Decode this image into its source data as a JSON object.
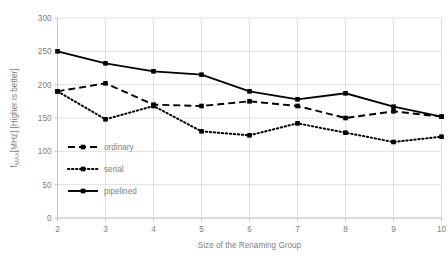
{
  "chart_data": {
    "type": "line",
    "title": "",
    "xlabel": "Size of the Renaming Group",
    "ylabel": "fₘₐₓ[MHz] [Higher is better]",
    "ylabel_parts": {
      "prefix": "f",
      "subscript": "MAX",
      "suffix": "[MHz] [Higher is better]"
    },
    "x": [
      2,
      3,
      4,
      5,
      6,
      7,
      8,
      9,
      10
    ],
    "xticklabels": [
      "2",
      "3",
      "4",
      "5",
      "6",
      "7",
      "8",
      "9",
      "10"
    ],
    "yticklabels": [
      "0",
      "50",
      "100",
      "150",
      "200",
      "250",
      "300"
    ],
    "yticks": [
      0,
      50,
      100,
      150,
      200,
      250,
      300
    ],
    "xlim": [
      2,
      10
    ],
    "ylim": [
      0,
      300
    ],
    "grid": true,
    "grid_color": "#D9D9D9",
    "legend_position": "inside-lower-left",
    "series": [
      {
        "name": "ordinary",
        "style": "dashed",
        "color": "#000000",
        "marker": "square",
        "values": [
          190,
          202,
          170,
          168,
          175,
          168,
          150,
          160,
          152
        ]
      },
      {
        "name": "serial",
        "style": "dotted",
        "color": "#000000",
        "marker": "square",
        "values": [
          190,
          148,
          168,
          130,
          124,
          142,
          128,
          114,
          122
        ]
      },
      {
        "name": "pipelined",
        "style": "solid",
        "color": "#000000",
        "marker": "square",
        "values": [
          250,
          232,
          220,
          215,
          190,
          178,
          187,
          167,
          152
        ]
      }
    ]
  },
  "legend": {
    "items": [
      {
        "label": "ordinary",
        "style": "dashed"
      },
      {
        "label": "serial",
        "style": "dotted"
      },
      {
        "label": "pipelined",
        "style": "solid"
      }
    ]
  }
}
